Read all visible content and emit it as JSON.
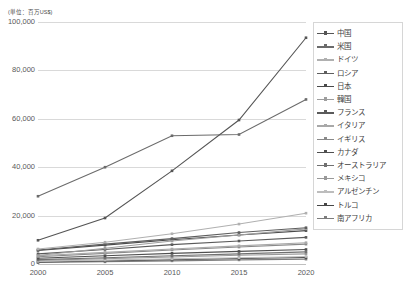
{
  "unit_note": "(単位：百万US$)",
  "legend": {
    "position": "right",
    "items": [
      {
        "label": "中国",
        "color": "#555555"
      },
      {
        "label": "米国",
        "color": "#6b6b6b"
      },
      {
        "label": "ドイツ",
        "color": "#b0b0b0"
      },
      {
        "label": "ロシア",
        "color": "#5e5e5e"
      },
      {
        "label": "日本",
        "color": "#4a4a4a"
      },
      {
        "label": "韓国",
        "color": "#9e9e9e"
      },
      {
        "label": "フランス",
        "color": "#5a5a5a"
      },
      {
        "label": "イタリア",
        "color": "#a8a8a8"
      },
      {
        "label": "イギリス",
        "color": "#8a8a8a"
      },
      {
        "label": "カナダ",
        "color": "#4f4f4f"
      },
      {
        "label": "オーストラリア",
        "color": "#707070"
      },
      {
        "label": "メキシコ",
        "color": "#999999"
      },
      {
        "label": "アルゼンチン",
        "color": "#bdbdbd"
      },
      {
        "label": "トルコ",
        "color": "#464646"
      },
      {
        "label": "南アフリカ",
        "color": "#7d7d7d"
      }
    ]
  },
  "axis": {
    "y_ticks": [
      "0",
      "20,000",
      "40,000",
      "60,000",
      "80,000",
      "100,000"
    ],
    "x_ticks": [
      "2000",
      "2005",
      "2010",
      "2015",
      "2020"
    ]
  },
  "chart_data": {
    "type": "line",
    "title": "",
    "subtitle": "",
    "xlabel": "",
    "ylabel": "(単位：百万US$)",
    "x": [
      2000,
      2005,
      2010,
      2015,
      2020
    ],
    "categories": [
      "2000",
      "2005",
      "2010",
      "2015",
      "2020"
    ],
    "ylim": [
      0,
      100000
    ],
    "xlim": [
      2000,
      2020
    ],
    "y_ticks_values": [
      0,
      20000,
      40000,
      60000,
      80000,
      100000
    ],
    "grid": true,
    "legend_position": "right",
    "markers": true,
    "series": [
      {
        "name": "中国",
        "color": "#555555",
        "values": [
          9800,
          19000,
          38500,
          59500,
          93500
        ]
      },
      {
        "name": "米国",
        "color": "#6b6b6b",
        "values": [
          28000,
          40000,
          53000,
          53500,
          68000
        ]
      },
      {
        "name": "ドイツ",
        "color": "#b0b0b0",
        "values": [
          6200,
          9000,
          12500,
          16500,
          21000
        ]
      },
      {
        "name": "ロシア",
        "color": "#5e5e5e",
        "values": [
          5800,
          8200,
          10500,
          13000,
          15000
        ]
      },
      {
        "name": "日本",
        "color": "#4a4a4a",
        "values": [
          5600,
          7800,
          10000,
          12000,
          13800
        ]
      },
      {
        "name": "韓国",
        "color": "#9e9e9e",
        "values": [
          3500,
          6500,
          9500,
          12000,
          14500
        ]
      },
      {
        "name": "フランス",
        "color": "#5a5a5a",
        "values": [
          4200,
          6000,
          8000,
          9500,
          11000
        ]
      },
      {
        "name": "イタリア",
        "color": "#a8a8a8",
        "values": [
          3400,
          4800,
          6200,
          7500,
          8800
        ]
      },
      {
        "name": "イギリス",
        "color": "#8a8a8a",
        "values": [
          3000,
          4400,
          5800,
          7000,
          8200
        ]
      },
      {
        "name": "カナダ",
        "color": "#4f4f4f",
        "values": [
          2400,
          3400,
          4400,
          5200,
          6000
        ]
      },
      {
        "name": "オーストラリア",
        "color": "#707070",
        "values": [
          1800,
          2600,
          3400,
          4200,
          5000
        ]
      },
      {
        "name": "メキシコ",
        "color": "#999999",
        "values": [
          1500,
          2200,
          2900,
          3600,
          4200
        ]
      },
      {
        "name": "アルゼンチン",
        "color": "#bdbdbd",
        "values": [
          1100,
          1600,
          2100,
          2600,
          3100
        ]
      },
      {
        "name": "トルコ",
        "color": "#464646",
        "values": [
          800,
          1300,
          1800,
          2300,
          2700
        ]
      },
      {
        "name": "南アフリカ",
        "color": "#7d7d7d",
        "values": [
          600,
          900,
          1300,
          1700,
          2000
        ]
      }
    ]
  }
}
